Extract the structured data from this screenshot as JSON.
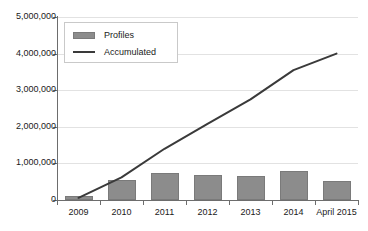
{
  "chart_data": {
    "type": "bar",
    "title": "",
    "xlabel": "",
    "ylabel": "",
    "grid": true,
    "legend_position": "top-left-inside",
    "categories": [
      "2009",
      "2010",
      "2011",
      "2012",
      "2013",
      "2014",
      "April 2015"
    ],
    "ylim": [
      0,
      5000000
    ],
    "yticks": [
      0,
      1000000,
      2000000,
      3000000,
      4000000,
      5000000
    ],
    "ytick_labels": [
      "0",
      "1,000,000",
      "2,000,000",
      "3,000,000",
      "4,000,000",
      "5,000,000"
    ],
    "series": [
      {
        "name": "Profiles",
        "type": "bar",
        "color": "#8c8c8c",
        "values": [
          100000,
          550000,
          750000,
          680000,
          650000,
          800000,
          520000
        ]
      },
      {
        "name": "Accumulated",
        "type": "line",
        "color": "#3a3a3a",
        "values": [
          60000,
          620000,
          1400000,
          2080000,
          2750000,
          3550000,
          4000000
        ]
      }
    ],
    "legend": [
      "Profiles",
      "Accumulated"
    ]
  },
  "colors": {
    "bar": "#8c8c8c",
    "bar_edge": "#7a7a7a",
    "line": "#3a3a3a",
    "grid": "#e2e2e2",
    "axis": "#6d6d6d",
    "text": "#1a1a1a",
    "background": "#ffffff",
    "legend_border": "#c9c9c9"
  }
}
